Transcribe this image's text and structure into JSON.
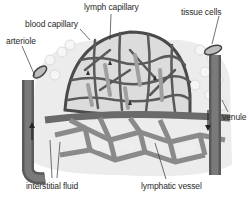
{
  "diagram": {
    "labels": {
      "lymph_capillary": "lymph capillary",
      "blood_capillary": "blood capillary",
      "tissue_cells": "tissue cells",
      "arteriole": "arteriole",
      "venule": "venule",
      "interstitial_fluid": "interstitial fluid",
      "lymphatic_vessel": "lymphatic vessel"
    },
    "colors": {
      "vessel_dark": "#5a5a5a",
      "vessel_mid": "#7d7d7d",
      "lymph_light": "#a8a8a8",
      "tissue_bg": "#e6e6e6",
      "cell_fill": "#f2f2f2",
      "text": "#2a2a2a"
    }
  }
}
